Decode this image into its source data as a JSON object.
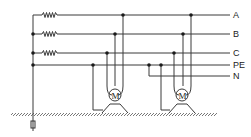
{
  "diagram": {
    "title": "",
    "type": "electrical-wiring",
    "lines": [
      {
        "id": "A",
        "label": "A"
      },
      {
        "id": "B",
        "label": "B"
      },
      {
        "id": "C",
        "label": "C"
      },
      {
        "id": "PE",
        "label": "PE"
      },
      {
        "id": "N",
        "label": "N"
      }
    ],
    "motors": [
      {
        "id": "motor-1",
        "label": "M"
      },
      {
        "id": "motor-2",
        "label": "M"
      }
    ],
    "resistors": 3,
    "ground": "earth-electrode"
  }
}
